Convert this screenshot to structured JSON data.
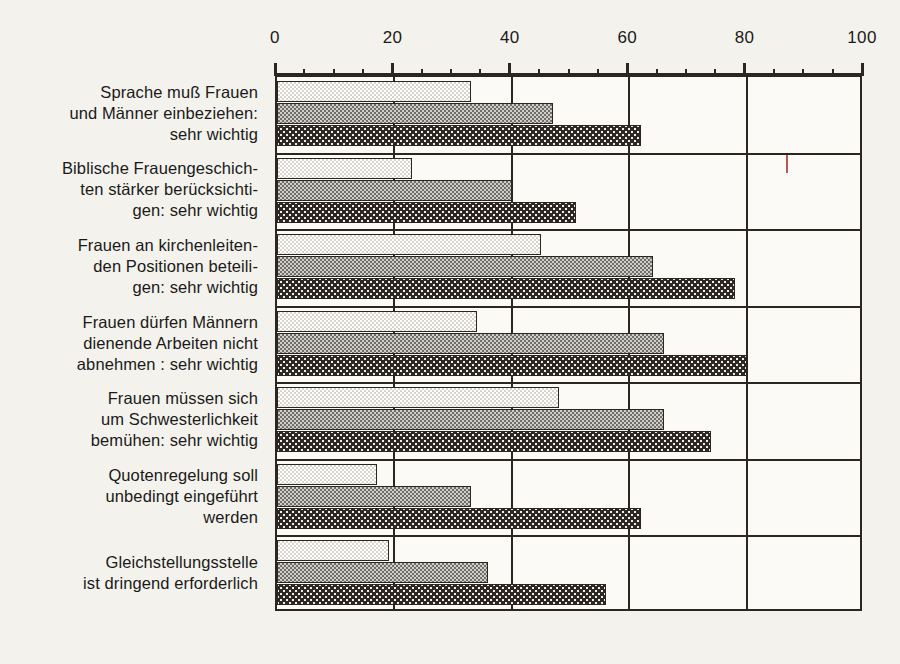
{
  "figure": {
    "background": "#f4f2ec",
    "ink": "#2b2620",
    "registration_mark_color": "#b03a33"
  },
  "chart_data": {
    "type": "bar",
    "orientation": "horizontal",
    "title": "",
    "subtitle": "",
    "xlabel": "",
    "ylabel": "",
    "xlim": [
      0,
      100
    ],
    "xticks": [
      0,
      20,
      40,
      60,
      80,
      100
    ],
    "xtick_labels": [
      "0",
      "20",
      "40",
      "60",
      "80",
      "100"
    ],
    "minor_tick_step": 5,
    "grid": "vertical gridlines at 20, 40, 60, 80",
    "legend": "none",
    "categories": [
      "Sprache muß Frauen\nund Männer einbeziehen:\nsehr wichtig",
      "Biblische Frauengeschich-\nten stärker berücksichti-\ngen: sehr wichtig",
      "Frauen an kirchenleiten-\nden Positionen beteili-\ngen: sehr wichtig",
      "Frauen dürfen Männern\ndienende Arbeiten nicht\nabnehmen : sehr wichtig",
      "Frauen müssen sich\num Schwesterlichkeit\nbemühen: sehr wichtig",
      "Quotenregelung soll\nunbedingt eingeführt\nwerden",
      "Gleichstellungsstelle\nist dringend erforderlich"
    ],
    "series": [
      {
        "name": "series-1-light",
        "fill": "light-checker",
        "color": "#d6d4cd",
        "values": [
          33,
          23,
          45,
          34,
          48,
          17,
          19
        ]
      },
      {
        "name": "series-2-medium",
        "fill": "medium-checker",
        "color": "#6f6f6b",
        "values": [
          47,
          40,
          64,
          66,
          66,
          33,
          36
        ]
      },
      {
        "name": "series-3-dark",
        "fill": "dark-dotted",
        "color": "#2e2824",
        "values": [
          62,
          51,
          78,
          80,
          74,
          62,
          56
        ]
      }
    ]
  }
}
